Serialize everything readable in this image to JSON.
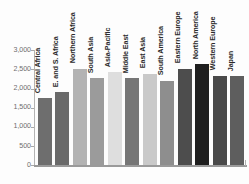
{
  "chart_data": {
    "type": "bar",
    "title": "",
    "subtitle": "",
    "xlabel": "",
    "ylabel": "",
    "ylim": [
      0,
      3000
    ],
    "grid": false,
    "legend": "none",
    "orientation": "vertical",
    "categories": [
      "Central Africa",
      "E. and S. Africa",
      "Northern Africa",
      "South Asia",
      "Asia-Pacific",
      "Middle East",
      "East Asia",
      "South America",
      "Eastern Europe",
      "North America",
      "Western Europe",
      "Japan"
    ],
    "values": [
      1750,
      1900,
      2520,
      2270,
      2420,
      2270,
      2380,
      2210,
      2520,
      2630,
      2340,
      2320
    ],
    "bar_colors": [
      "#6e6e6e",
      "#6a6a6a",
      "#b3b3b3",
      "#9b9b9b",
      "#dedede",
      "#767676",
      "#c9c9c9",
      "#8e8e8e",
      "#4d4d4d",
      "#1f1f1f",
      "#4a4a4a",
      "#5e5e5e"
    ],
    "yticks": [
      0,
      500,
      1000,
      1500,
      2000,
      2500,
      3000
    ],
    "ytick_labels": [
      "0",
      "500",
      "1,000",
      "1,500",
      "2,000",
      "2,500",
      "3,000"
    ],
    "axis_color": "#b0b0b0",
    "tick_label_color": "#6e6e6e",
    "category_label_color": "#2b2b2b",
    "background_color": "#fdfdfd"
  }
}
